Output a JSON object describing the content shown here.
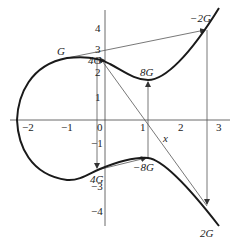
{
  "figure": {
    "type": "elliptic-curve-point-doubling-diagram",
    "colors": {
      "curve": "#1a1a1a",
      "lines": "#555555",
      "axes": "#444444",
      "text": "#222222"
    },
    "axes": {
      "x_label": "x",
      "x_ticks": [
        "−2",
        "−1",
        "0",
        "1",
        "2",
        "3"
      ],
      "y_ticks_pos": [
        "1",
        "2",
        "3",
        "4"
      ],
      "y_ticks_neg": [
        "−1",
        "−3",
        "−4"
      ]
    },
    "points": {
      "G": "G",
      "four_g_top": "4G",
      "eight_g": "8G",
      "neg_two_g": "−2G",
      "four_g_bottom": "4G",
      "neg_eight_g": "−8G",
      "two_g": "2G"
    }
  }
}
